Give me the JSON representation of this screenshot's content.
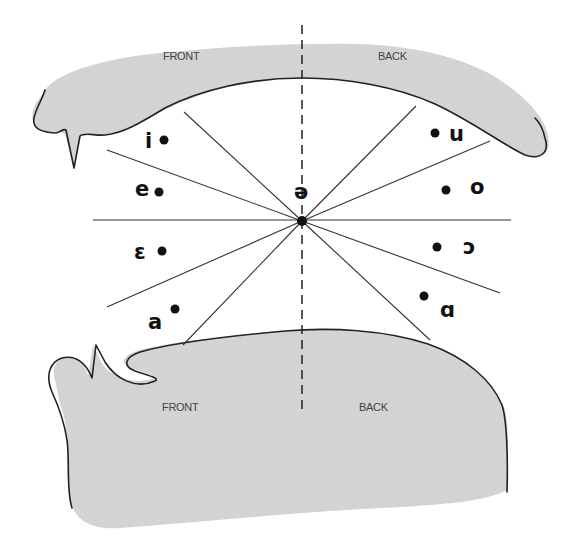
{
  "diagram": {
    "type": "vowel-tongue-position-diagram",
    "upper_labels": {
      "front": "FRONT",
      "back": "BACK"
    },
    "lower_labels": {
      "front": "FRONT",
      "back": "BACK"
    },
    "center_vowel": "ə",
    "front_vowels": [
      {
        "symbol": "i",
        "position": "high front"
      },
      {
        "symbol": "e",
        "position": "mid-high front"
      },
      {
        "symbol": "ɛ",
        "position": "mid-low front"
      },
      {
        "symbol": "a",
        "position": "low front"
      }
    ],
    "back_vowels": [
      {
        "symbol": "u",
        "position": "high back"
      },
      {
        "symbol": "o",
        "position": "mid-high back"
      },
      {
        "symbol": "ɔ",
        "position": "mid-low back"
      },
      {
        "symbol": "ɑ",
        "position": "low back"
      }
    ],
    "colors": {
      "fill": "#d6d6d6",
      "stroke": "#222222",
      "background": "#ffffff"
    }
  }
}
